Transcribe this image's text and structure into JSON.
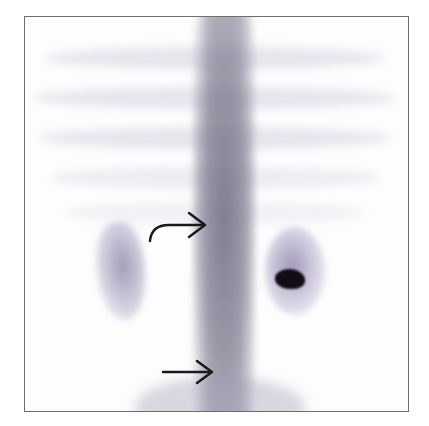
{
  "figure": {
    "type": "nuclear medicine scintigraphy (posterior view)",
    "annotations": [
      {
        "id": "curved-arrow",
        "description": "curved arrow pointing right to spine region at mid level"
      },
      {
        "id": "straight-arrow",
        "description": "straight arrow pointing right to focal uptake in lower spine"
      }
    ],
    "colors": {
      "frame": "#6e6e6e",
      "uptake": "#7a7890",
      "hotspot": "#140c14",
      "arrow": "#1a1a1a"
    }
  }
}
